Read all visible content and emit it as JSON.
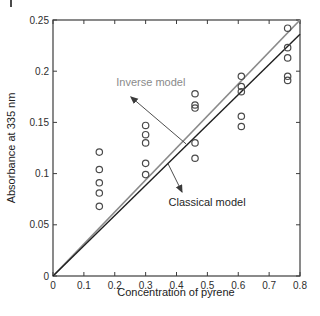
{
  "figure": {
    "background": "#ffffff",
    "corner_mark": true
  },
  "chart_data": {
    "type": "scatter",
    "title": "",
    "xlabel": "Concentration of pyrene",
    "ylabel": "Absorbance at 335 nm",
    "xlim": [
      0,
      0.8
    ],
    "ylim": [
      0,
      0.25
    ],
    "xticks": [
      0,
      0.1,
      0.2,
      0.3,
      0.4,
      0.5,
      0.6,
      0.7,
      0.8
    ],
    "xtick_labels": [
      "0",
      "0.1",
      "0.2",
      "0.3",
      "0.4",
      "0.5",
      "0.6",
      "0.7",
      "0.8"
    ],
    "yticks": [
      0,
      0.05,
      0.1,
      0.15,
      0.2,
      0.25
    ],
    "ytick_labels": [
      "0",
      "0.05",
      "0.1",
      "0.15",
      "0.2",
      "0.25"
    ],
    "grid": false,
    "box": true,
    "tick_style": "inward-all-sides",
    "axis_color": "#3c3c3c",
    "series": [
      {
        "name": "replicate-measurements",
        "type": "scatter",
        "marker": "open-circle",
        "color": "#4a4a4a",
        "points": [
          [
            0.15,
            0.068
          ],
          [
            0.15,
            0.081
          ],
          [
            0.15,
            0.091
          ],
          [
            0.15,
            0.104
          ],
          [
            0.15,
            0.121
          ],
          [
            0.3,
            0.099
          ],
          [
            0.3,
            0.11
          ],
          [
            0.3,
            0.13
          ],
          [
            0.3,
            0.138
          ],
          [
            0.3,
            0.147
          ],
          [
            0.46,
            0.115
          ],
          [
            0.46,
            0.13
          ],
          [
            0.46,
            0.164
          ],
          [
            0.46,
            0.167
          ],
          [
            0.46,
            0.178
          ],
          [
            0.61,
            0.146
          ],
          [
            0.61,
            0.156
          ],
          [
            0.61,
            0.18
          ],
          [
            0.61,
            0.185
          ],
          [
            0.61,
            0.195
          ],
          [
            0.76,
            0.191
          ],
          [
            0.76,
            0.195
          ],
          [
            0.76,
            0.213
          ],
          [
            0.76,
            0.223
          ],
          [
            0.76,
            0.242
          ]
        ]
      },
      {
        "name": "Inverse model",
        "type": "line",
        "color": "#8a8a8a",
        "width": 1.7,
        "points": [
          [
            0,
            0
          ],
          [
            0.8,
            0.25
          ]
        ]
      },
      {
        "name": "Classical model",
        "type": "line",
        "color": "#1f1f1f",
        "width": 1.4,
        "points": [
          [
            0,
            0
          ],
          [
            0.8,
            0.236
          ]
        ]
      }
    ],
    "annotations": [
      {
        "text": "Inverse model",
        "color": "#8a8a8a",
        "text_xy": [
          0.317,
          0.189
        ],
        "arrow_from": [
          0.431,
          0.129
        ],
        "arrow_to": [
          0.252,
          0.175
        ],
        "arrow_color": "#3a3a3a"
      },
      {
        "text": "Classical model",
        "color": "#1f1f1f",
        "text_xy": [
          0.499,
          0.072
        ],
        "arrow_from": [
          0.372,
          0.11
        ],
        "arrow_to": [
          0.418,
          0.082
        ],
        "arrow_color": "#3a3a3a"
      }
    ],
    "legend_position": "none"
  }
}
